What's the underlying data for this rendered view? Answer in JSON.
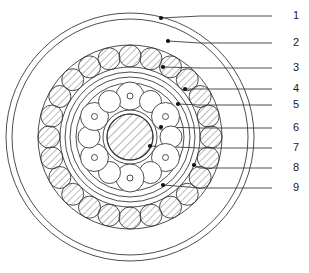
{
  "figure": {
    "title": "",
    "type": "cross-section-diagram",
    "background_color": "#ffffff",
    "line_color": "#3a3a3a",
    "hatch_color": "#555555",
    "dot_color": "#111111",
    "center": {
      "x": 130,
      "y": 137
    }
  },
  "callouts": [
    {
      "id": "1",
      "label": "1",
      "text_x": 293,
      "text_y": 16,
      "line_x_start": 272,
      "line_y": 16,
      "dot_x": 161,
      "dot_y": 18,
      "bend_x": 200
    },
    {
      "id": "2",
      "label": "2",
      "text_x": 293,
      "text_y": 43,
      "line_x_start": 272,
      "line_y": 43,
      "dot_x": 168,
      "dot_y": 41,
      "bend_x": 200
    },
    {
      "id": "3",
      "label": "3",
      "text_x": 293,
      "text_y": 68,
      "line_x_start": 272,
      "line_y": 68,
      "dot_x": 163,
      "dot_y": 67,
      "bend_x": 200
    },
    {
      "id": "4",
      "label": "4",
      "text_x": 293,
      "text_y": 89,
      "line_x_start": 272,
      "line_y": 89,
      "dot_x": 185,
      "dot_y": 89,
      "bend_x": 200
    },
    {
      "id": "5",
      "label": "5",
      "text_x": 293,
      "text_y": 105,
      "line_x_start": 272,
      "line_y": 105,
      "dot_x": 178,
      "dot_y": 104,
      "bend_x": 200
    },
    {
      "id": "6",
      "label": "6",
      "text_x": 293,
      "text_y": 128,
      "line_x_start": 272,
      "line_y": 128,
      "dot_x": 161,
      "dot_y": 127,
      "bend_x": 200
    },
    {
      "id": "7",
      "label": "7",
      "text_x": 293,
      "text_y": 148,
      "line_x_start": 272,
      "line_y": 148,
      "dot_x": 150,
      "dot_y": 146,
      "bend_x": 200
    },
    {
      "id": "8",
      "label": "8",
      "text_x": 293,
      "text_y": 168,
      "line_x_start": 272,
      "line_y": 168,
      "dot_x": 194,
      "dot_y": 165,
      "bend_x": 200
    },
    {
      "id": "9",
      "label": "9",
      "text_x": 293,
      "text_y": 188,
      "line_x_start": 272,
      "line_y": 188,
      "dot_x": 163,
      "dot_y": 185,
      "bend_x": 200
    }
  ],
  "geometry": {
    "concentric_circles": [
      {
        "name": "outer-housing-circle",
        "r": 124
      },
      {
        "name": "outer-race-circle",
        "r": 118
      },
      {
        "name": "outer-ring-seat-circle",
        "r": 92
      },
      {
        "name": "mid-race-outer-circle",
        "r": 70
      },
      {
        "name": "mid-race-mid-circle",
        "r": 65
      },
      {
        "name": "mid-race-inner-circle",
        "r": 60
      },
      {
        "name": "cage-outer-circle",
        "r": 54
      },
      {
        "name": "inner-race-outer-circle",
        "r": 27
      },
      {
        "name": "inner-shaft-circle",
        "r": 23
      }
    ],
    "outer_ball_ring": {
      "name": "outer-ball-ring",
      "count": 24,
      "orbit_radius": 81,
      "ball_radius": 11,
      "hatched": true,
      "start_angle_deg": -90
    },
    "inner_roller_ring": {
      "name": "inner-roller-ring",
      "count": 12,
      "orbit_radius": 41,
      "large_radius": 14,
      "small_radius": 11,
      "small_hole_radius": 3,
      "alternating": true,
      "start_angle_deg": -90
    },
    "center_hub": {
      "name": "center-hub",
      "radius": 23,
      "hatched": true
    }
  }
}
